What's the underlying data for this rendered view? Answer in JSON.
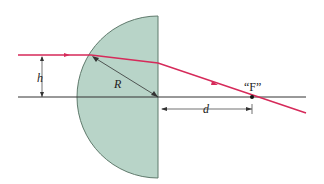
{
  "diagram": {
    "labels": {
      "height": "h",
      "radius": "R",
      "distance": "d",
      "focus": "“F”"
    },
    "colors": {
      "ray": "#d62a5a",
      "lens_fill": "#b8d4c8",
      "lens_stroke": "#557060",
      "axis": "#333333",
      "dimension": "#333333"
    }
  }
}
